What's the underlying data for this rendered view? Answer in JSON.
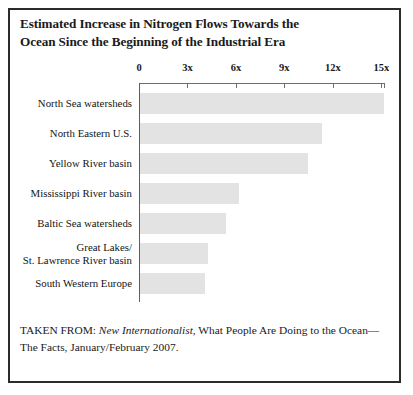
{
  "figure": {
    "title_lines": [
      "Estimated Increase in Nitrogen Flows Towards the",
      "Ocean Since the Beginning of the Industrial Era"
    ],
    "caption": {
      "prefix": "TAKEN FROM: ",
      "source_italic": "New Internationalist",
      "suffix": ", What People Are Doing to the Ocean—The Facts, January/February 2007."
    },
    "colors": {
      "bar_fill": "#e3e3e3",
      "axis": "#6d6d6d",
      "border": "#2b2b2b",
      "text": "#1a1a1a",
      "background": "#ffffff"
    }
  },
  "chart_data": {
    "type": "bar",
    "orientation": "horizontal",
    "title": "Estimated Increase in Nitrogen Flows Towards the Ocean Since the Beginning of the Industrial Era",
    "xlabel": "",
    "ylabel": "",
    "xlim": [
      0,
      15.5
    ],
    "grid": false,
    "legend": false,
    "axis_position": "top",
    "tick_labels": [
      "0",
      "3x",
      "6x",
      "9x",
      "12x",
      "15x"
    ],
    "tick_values": [
      0,
      3,
      6,
      9,
      12,
      15
    ],
    "categories": [
      "North Sea watersheds",
      "North Eastern U.S.",
      "Yellow River basin",
      "Mississippi River basin",
      "Baltic Sea watersheds",
      "Great Lakes/ St. Lawrence River basin",
      "South Western Europe"
    ],
    "category_lines": [
      [
        "North Sea watersheds"
      ],
      [
        "North Eastern U.S."
      ],
      [
        "Yellow River basin"
      ],
      [
        "Mississippi River basin"
      ],
      [
        "Baltic Sea watersheds"
      ],
      [
        "Great Lakes/",
        "St. Lawrence River basin"
      ],
      [
        "South Western Europe"
      ]
    ],
    "values": [
      15.1,
      11.3,
      10.4,
      6.1,
      5.3,
      4.2,
      4.0
    ],
    "units": "x (multiple of pre-industrial flow)"
  }
}
